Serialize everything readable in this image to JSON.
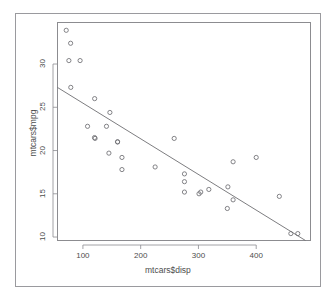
{
  "plot": {
    "type": "r-base-graphics-scatterplot",
    "background": "#ffffff",
    "frame_color": "#9a9a9e",
    "box_color": "#8c8c90",
    "point_color": "#6e6e72",
    "line_color": "#6e6e72"
  },
  "axes": {
    "x_title": "mtcars$disp",
    "y_title": "mtcars$mpg",
    "x_ticks": [
      "100",
      "200",
      "300",
      "400"
    ],
    "y_ticks": [
      "30",
      "25",
      "20",
      "15",
      "10"
    ]
  },
  "chart_data": {
    "type": "scatter",
    "title": "",
    "subtitle": "",
    "xlabel": "mtcars$disp",
    "ylabel": "mtcars$mpg",
    "xlim": [
      56,
      494
    ],
    "ylim": [
      9.6,
      34.8
    ],
    "xticks": [
      100,
      200,
      300,
      400
    ],
    "yticks": [
      10,
      15,
      20,
      25,
      30
    ],
    "grid": false,
    "legend": null,
    "point_symbol": "open-circle",
    "series": [
      {
        "name": "mtcars",
        "x": [
          160,
          160,
          108,
          258,
          360,
          225,
          360,
          146.7,
          140.8,
          167.6,
          167.6,
          275.8,
          275.8,
          275.8,
          472,
          460,
          440,
          78.7,
          75.7,
          71.1,
          120.1,
          318,
          304,
          350,
          400,
          79,
          120.3,
          95.1,
          351,
          145,
          301,
          121
        ],
        "y": [
          21,
          21,
          22.8,
          21.4,
          18.7,
          18.1,
          14.3,
          24.4,
          22.8,
          19.2,
          17.8,
          16.4,
          17.3,
          15.2,
          10.4,
          10.4,
          14.7,
          32.4,
          30.4,
          33.9,
          21.5,
          15.5,
          15.2,
          13.3,
          19.2,
          27.3,
          26,
          30.4,
          15.8,
          19.7,
          15,
          21.4
        ]
      }
    ],
    "regression_line": {
      "type": "lm",
      "intercept": 29.59985,
      "slope": -0.041215,
      "x_start": 56,
      "x_end": 494,
      "y_start": 27.29,
      "y_end": 9.24
    }
  }
}
